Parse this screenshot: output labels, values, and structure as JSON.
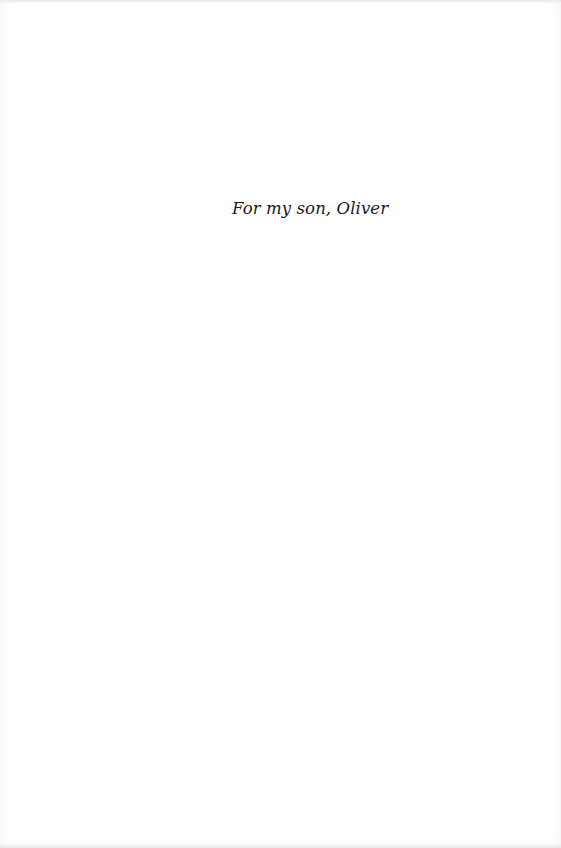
{
  "page": {
    "type": "dedication",
    "dedication_text": "For my son, Oliver"
  },
  "colors": {
    "background": "#fefefe",
    "text": "#1a1a1a"
  }
}
